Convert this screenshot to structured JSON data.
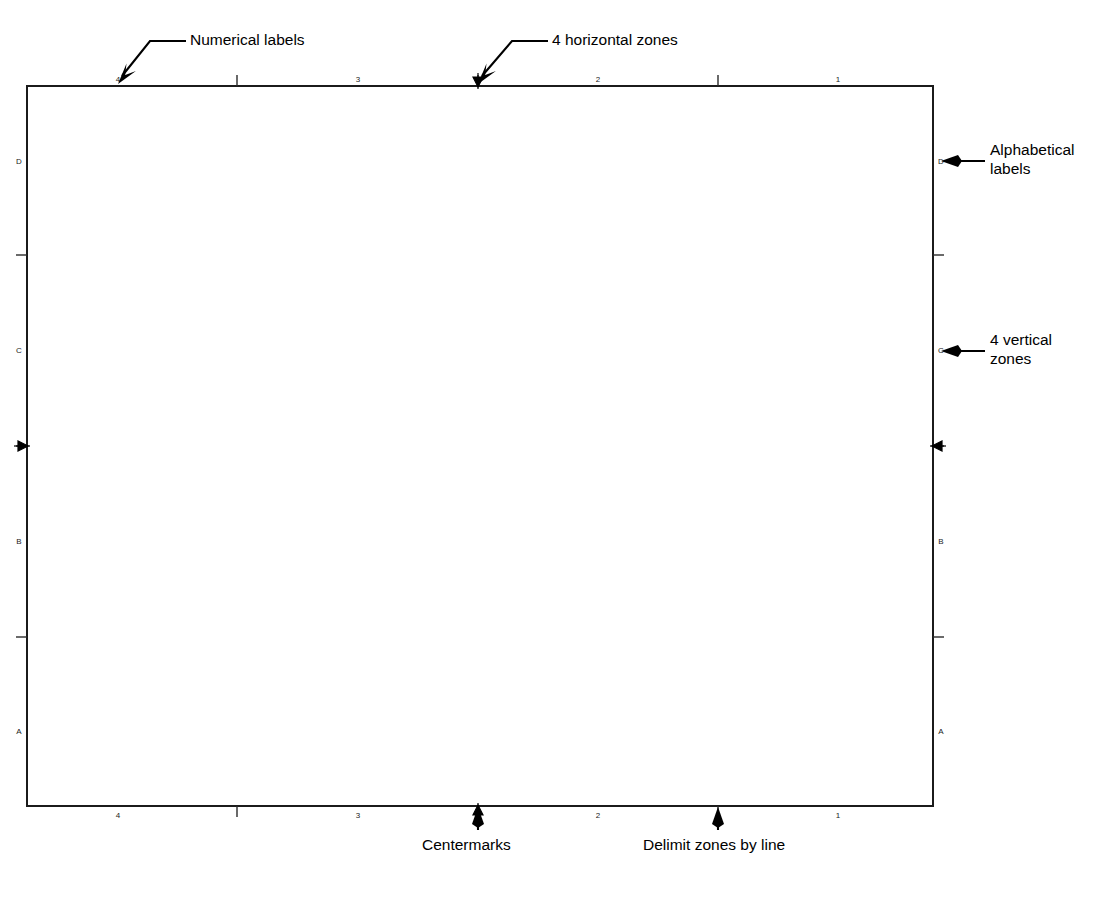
{
  "drawing": {
    "title": "Drawing frame zone layout",
    "frame": {
      "left": 27,
      "top": 86,
      "right": 933,
      "bottom": 806
    },
    "horizontal_zones": {
      "count": 4,
      "labels": [
        "4",
        "3",
        "2",
        "1"
      ],
      "label_x": [
        118,
        358,
        598,
        838
      ],
      "delimiter_x": [
        237,
        478,
        718
      ],
      "centermark_x": 478
    },
    "vertical_zones": {
      "count": 4,
      "labels": [
        "D",
        "C",
        "B",
        "A"
      ],
      "label_y": [
        161,
        350,
        541,
        731
      ],
      "delimiter_y": [
        255,
        446,
        637
      ],
      "centermark_y": 446
    }
  },
  "annotations": [
    {
      "id": "numerical-labels",
      "text": "Numerical labels",
      "text_x": 190,
      "text_y": 30,
      "leader": "M 186 41 L 150 41 L 122 76",
      "arrow_at": [
        118,
        84
      ],
      "arrow_dir": "down-left"
    },
    {
      "id": "horizontal-zones",
      "text": "4 horizontal zones",
      "text_x": 552,
      "text_y": 30,
      "leader": "M 548 41 L 512 41 L 482 76",
      "arrow_at": [
        478,
        84
      ],
      "arrow_dir": "down-left"
    },
    {
      "id": "alphabetical-labels",
      "text": "Alphabetical\nlabels",
      "text_x": 990,
      "text_y": 140,
      "leader": "M 985 161 L 952 161",
      "arrow_at": [
        941,
        161
      ],
      "arrow_dir": "left"
    },
    {
      "id": "vertical-zones",
      "text": "4 vertical\nzones",
      "text_x": 990,
      "text_y": 330,
      "leader": "M 985 351 L 952 351",
      "arrow_at": [
        941,
        351
      ],
      "arrow_dir": "left"
    },
    {
      "id": "centermarks",
      "text": "Centermarks",
      "text_x": 422,
      "text_y": 835,
      "leader": "M 478 830 L 478 818",
      "arrow_at": [
        478,
        807
      ],
      "arrow_dir": "up"
    },
    {
      "id": "delimit-zones",
      "text": "Delimit zones by line",
      "text_x": 643,
      "text_y": 835,
      "leader": "M 718 830 L 718 818",
      "arrow_at": [
        718,
        807
      ],
      "arrow_dir": "up"
    }
  ],
  "colors": {
    "ink": "#000000",
    "frame": "#1b1b1b",
    "paper": "#ffffff"
  }
}
